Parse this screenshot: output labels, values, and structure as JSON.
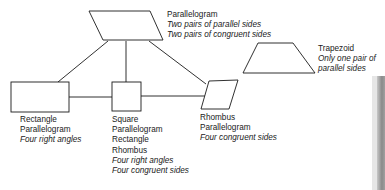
{
  "diagram": {
    "nodes": [
      {
        "id": "parallelogram",
        "shape": "parallelogram",
        "name": "Parallelogram",
        "properties": [
          "Two pairs of parallel sides",
          "Two pairs of congruent sides"
        ]
      },
      {
        "id": "trapezoid",
        "shape": "trapezoid",
        "name": "Trapezoid",
        "properties": [
          "Only one pair of",
          "parallel sides"
        ]
      },
      {
        "id": "rectangle",
        "shape": "rectangle",
        "name": "Rectangle",
        "parents": [
          "Parallelogram"
        ],
        "properties": [
          "Four right angles"
        ]
      },
      {
        "id": "square",
        "shape": "square",
        "name": "Square",
        "parents": [
          "Parallelogram",
          "Rectangle",
          "Rhombus"
        ],
        "properties": [
          "Four right angles",
          "Four congruent sides"
        ]
      },
      {
        "id": "rhombus",
        "shape": "rhombus",
        "name": "Rhombus",
        "parents": [
          "Parallelogram"
        ],
        "properties": [
          "Four congruent sides"
        ]
      }
    ],
    "edges": [
      [
        "parallelogram",
        "rectangle"
      ],
      [
        "parallelogram",
        "square"
      ],
      [
        "parallelogram",
        "rhombus"
      ],
      [
        "rectangle",
        "square"
      ],
      [
        "square",
        "rhombus"
      ]
    ],
    "colors": {
      "stroke": "#1a1a1a",
      "background": "#ffffff",
      "text": "#1a1a1a"
    }
  }
}
